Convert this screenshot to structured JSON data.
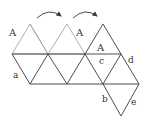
{
  "diagram": {
    "type": "geometric-net",
    "colors": {
      "background": "#ffffff",
      "light_line": "#9a9a9a",
      "dark_line": "#3a3a3a",
      "label": "#333333"
    },
    "labels": {
      "A1": "A",
      "A2": "A",
      "A3": "A",
      "a": "a",
      "b": "b",
      "c": "c",
      "d": "d",
      "e": "e"
    },
    "arrows": [
      {
        "from": [
          37,
          17
        ],
        "to": [
          62,
          16
        ],
        "direction": "clockwise-arc"
      },
      {
        "from": [
          73,
          17
        ],
        "to": [
          99,
          16
        ],
        "direction": "clockwise-arc"
      }
    ]
  }
}
